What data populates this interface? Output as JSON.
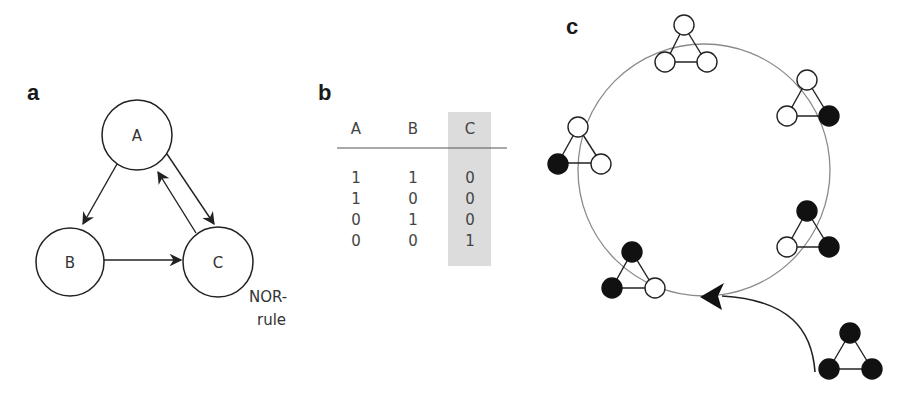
{
  "panels": {
    "a": {
      "label": "a",
      "nodes": [
        {
          "id": "A",
          "label": "A",
          "cx": 137,
          "cy": 135,
          "r": 35
        },
        {
          "id": "B",
          "label": "B",
          "cx": 70,
          "cy": 262,
          "r": 34
        },
        {
          "id": "C",
          "label": "C",
          "cx": 218,
          "cy": 262,
          "r": 35
        }
      ],
      "edges": [
        {
          "from": "A",
          "to": "B"
        },
        {
          "from": "A",
          "to": "C"
        },
        {
          "from": "C",
          "to": "A"
        },
        {
          "from": "B",
          "to": "C"
        }
      ],
      "rule_label_line1": "NOR-",
      "rule_label_line2": "rule"
    },
    "b": {
      "label": "b",
      "columns": [
        "A",
        "B",
        "C"
      ],
      "highlighted_column": "C",
      "highlight_color": "#d9d9d9",
      "rows": [
        [
          "1",
          "1",
          "0"
        ],
        [
          "1",
          "0",
          "0"
        ],
        [
          "0",
          "1",
          "0"
        ],
        [
          "0",
          "0",
          "1"
        ]
      ]
    },
    "c": {
      "label": "c",
      "cycle_states": [
        {
          "position": "top",
          "A": "off",
          "B": "off",
          "C": "off"
        },
        {
          "position": "upper-right",
          "A": "off",
          "B": "off",
          "C": "on"
        },
        {
          "position": "lower-right",
          "A": "on",
          "B": "off",
          "C": "on"
        },
        {
          "position": "bottom-left",
          "A": "on",
          "B": "on",
          "C": "off"
        },
        {
          "position": "left",
          "A": "off",
          "B": "on",
          "C": "off"
        }
      ],
      "entry_state": {
        "position": "outside-bottom-right",
        "A": "on",
        "B": "on",
        "C": "on"
      },
      "colors": {
        "on": "#111111",
        "off": "#ffffff",
        "cycle_circle": "#8a8a8a"
      }
    }
  }
}
